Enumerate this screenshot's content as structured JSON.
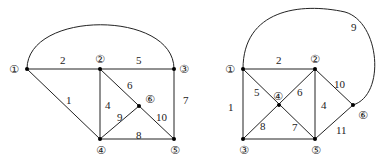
{
  "graphs": [
    {
      "name": "left-graph",
      "nodes": [
        {
          "id": "①",
          "x": 27,
          "y": 69,
          "lx": 9,
          "ly": 73
        },
        {
          "id": "②",
          "x": 100,
          "y": 69,
          "lx": 95,
          "ly": 63
        },
        {
          "id": "③",
          "x": 174,
          "y": 69,
          "lx": 179,
          "ly": 73
        },
        {
          "id": "④",
          "x": 100,
          "y": 139,
          "lx": 96,
          "ly": 154
        },
        {
          "id": "⑤",
          "x": 174,
          "y": 139,
          "lx": 170,
          "ly": 154
        },
        {
          "id": "⑥",
          "x": 139,
          "y": 106,
          "lx": 145,
          "ly": 103
        }
      ],
      "edges": [
        {
          "label": "1",
          "from": "①",
          "to": "④",
          "lx": 62,
          "ly": 103
        },
        {
          "label": "2",
          "from": "①",
          "to": "②",
          "lx": 60,
          "ly": 64
        },
        {
          "label": "3",
          "from": "①",
          "to": "③",
          "curve": true,
          "lx": 0,
          "ly": 0,
          "hidden_label": true
        },
        {
          "label": "4",
          "from": "②",
          "to": "④",
          "lx": 105,
          "ly": 108
        },
        {
          "label": "5",
          "from": "②",
          "to": "③",
          "lx": 135,
          "ly": 64
        },
        {
          "label": "6",
          "from": "②",
          "to": "⑥",
          "lx": 128,
          "ly": 88
        },
        {
          "label": "7",
          "from": "③",
          "to": "⑤",
          "lx": 183,
          "ly": 104
        },
        {
          "label": "8",
          "from": "④",
          "to": "⑤",
          "lx": 135,
          "ly": 139
        },
        {
          "label": "9",
          "from": "④",
          "to": "⑥",
          "lx": 117,
          "ly": 120
        },
        {
          "label": "10",
          "from": "⑥",
          "to": "⑤",
          "lx": 155,
          "ly": 121
        }
      ]
    },
    {
      "name": "right-graph",
      "nodes": [
        {
          "id": "①",
          "x": 243,
          "y": 69,
          "lx": 225,
          "ly": 73
        },
        {
          "id": "②",
          "x": 315,
          "y": 69,
          "lx": 310,
          "ly": 63
        },
        {
          "id": "③",
          "x": 243,
          "y": 139,
          "lx": 239,
          "ly": 154
        },
        {
          "id": "④",
          "x": 279,
          "y": 105,
          "lx": 273,
          "ly": 99
        },
        {
          "id": "⑤",
          "x": 315,
          "y": 139,
          "lx": 311,
          "ly": 154
        },
        {
          "id": "⑥",
          "x": 353,
          "y": 105,
          "lx": 358,
          "ly": 119
        }
      ],
      "edges": [
        {
          "label": "1",
          "from": "①",
          "to": "③",
          "lx": 228,
          "ly": 110
        },
        {
          "label": "2",
          "from": "①",
          "to": "②",
          "lx": 275,
          "ly": 64
        },
        {
          "label": "4",
          "from": "②",
          "to": "⑤",
          "lx": 321,
          "ly": 108
        },
        {
          "label": "5",
          "from": "①",
          "to": "④",
          "lx": 253,
          "ly": 95
        },
        {
          "label": "6",
          "from": "②",
          "to": "④",
          "lx": 297,
          "ly": 95
        },
        {
          "label": "7",
          "from": "④",
          "to": "⑤",
          "lx": 292,
          "ly": 131
        },
        {
          "label": "8",
          "from": "④",
          "to": "③",
          "lx": 260,
          "ly": 130
        },
        {
          "label": "9",
          "from": "①",
          "to": "⑥",
          "curve": true,
          "lx": 351,
          "ly": 31
        },
        {
          "label": "10",
          "from": "②",
          "to": "⑥",
          "lx": 334,
          "ly": 88
        },
        {
          "label": "11",
          "from": "⑤",
          "to": "⑥",
          "lx": 335,
          "ly": 134
        },
        {
          "label": "",
          "from": "③",
          "to": "⑤",
          "hidden_label": true
        }
      ]
    }
  ]
}
